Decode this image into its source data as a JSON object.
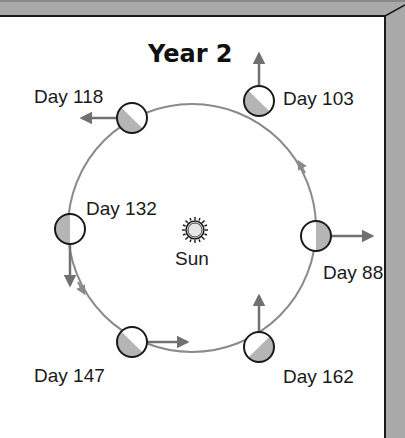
{
  "title": "Year 2",
  "sun": {
    "label": "Sun",
    "icon": "sun-icon"
  },
  "orbit": {
    "direction": "counterclockwise",
    "stroke": "#8a8a8a"
  },
  "positions": [
    {
      "label": "Day 88",
      "shaded_side": "right",
      "arrow": "right"
    },
    {
      "label": "Day 103",
      "shaded_side": "lower-left",
      "arrow": "up"
    },
    {
      "label": "Day 118",
      "shaded_side": "lower-left",
      "arrow": "left"
    },
    {
      "label": "Day 132",
      "shaded_side": "left",
      "arrow": "down"
    },
    {
      "label": "Day 147",
      "shaded_side": "lower-left",
      "arrow": "right"
    },
    {
      "label": "Day 162",
      "shaded_side": "lower-right",
      "arrow": "up"
    }
  ],
  "colors": {
    "frame_gray": "#a9a9a9",
    "shade_gray": "#b5b5b5",
    "arrow_gray": "#707070",
    "outline": "#1a1a1a"
  }
}
